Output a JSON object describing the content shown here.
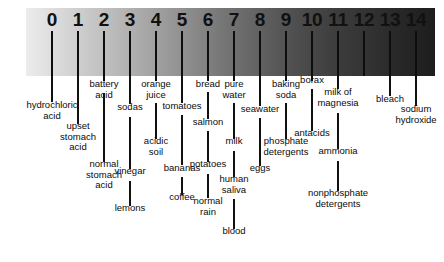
{
  "figure": {
    "gradient_start_color": "#ececec",
    "gradient_end_color": "#1d1d1d"
  },
  "chart_data": {
    "type": "bar",
    "xlabel": "",
    "ylabel": "",
    "xlim": [
      0,
      14
    ],
    "grid": false,
    "legend": null,
    "axis_tick_labels": [
      "0",
      "1",
      "2",
      "3",
      "4",
      "5",
      "6",
      "7",
      "8",
      "9",
      "10",
      "11",
      "12",
      "13",
      "14"
    ],
    "axis_tick_values": [
      0,
      1,
      2,
      3,
      4,
      5,
      6,
      7,
      8,
      9,
      10,
      11,
      12,
      13,
      14
    ],
    "categories": [
      "0",
      "1",
      "2",
      "3",
      "4",
      "5",
      "6",
      "7",
      "8",
      "9",
      "10",
      "11",
      "12",
      "13",
      "14"
    ],
    "values": [
      0,
      1,
      2,
      3,
      4,
      5,
      6,
      7,
      8,
      9,
      10,
      11,
      12,
      13,
      14
    ],
    "annotations": [
      {
        "label": "hydrochloric\nacid",
        "ph": 0
      },
      {
        "label": "upset\nstomach\nacid",
        "ph": 1
      },
      {
        "label": "battery\nacid",
        "ph": 2
      },
      {
        "label": "normal\nstomach\nacid",
        "ph": 2
      },
      {
        "label": "sodas",
        "ph": 3
      },
      {
        "label": "vinegar",
        "ph": 3
      },
      {
        "label": "lemons",
        "ph": 3
      },
      {
        "label": "orange\njuice",
        "ph": 4
      },
      {
        "label": "acidic\nsoil",
        "ph": 4
      },
      {
        "label": "tomatoes",
        "ph": 5
      },
      {
        "label": "bananas",
        "ph": 5
      },
      {
        "label": "coffee",
        "ph": 5
      },
      {
        "label": "bread",
        "ph": 6
      },
      {
        "label": "salmon",
        "ph": 6
      },
      {
        "label": "potatoes",
        "ph": 6
      },
      {
        "label": "normal\nrain",
        "ph": 6
      },
      {
        "label": "pure\nwater",
        "ph": 7
      },
      {
        "label": "milk",
        "ph": 7
      },
      {
        "label": "human\nsaliva",
        "ph": 7
      },
      {
        "label": "blood",
        "ph": 7
      },
      {
        "label": "seawater",
        "ph": 8
      },
      {
        "label": "eggs",
        "ph": 8
      },
      {
        "label": "baking\nsoda",
        "ph": 9
      },
      {
        "label": "phosphate\ndetergents",
        "ph": 9
      },
      {
        "label": "borax",
        "ph": 10
      },
      {
        "label": "antacids",
        "ph": 10
      },
      {
        "label": "milk of\nmagnesia",
        "ph": 11
      },
      {
        "label": "ammonia",
        "ph": 11
      },
      {
        "label": "nonphosphate\ndetergents",
        "ph": 11
      },
      {
        "label": "bleach",
        "ph": 13
      },
      {
        "label": "sodium\nhydroxide",
        "ph": 14
      }
    ]
  },
  "ticks": [
    {
      "value": "0",
      "x": 52,
      "mark_top": 31,
      "mark_height": 45
    },
    {
      "value": "1",
      "x": 78,
      "mark_top": 31,
      "mark_height": 45
    },
    {
      "value": "2",
      "x": 104,
      "mark_top": 31,
      "mark_height": 45
    },
    {
      "value": "3",
      "x": 130,
      "mark_top": 31,
      "mark_height": 45
    },
    {
      "value": "4",
      "x": 156,
      "mark_top": 31,
      "mark_height": 45
    },
    {
      "value": "5",
      "x": 182,
      "mark_top": 31,
      "mark_height": 45
    },
    {
      "value": "6",
      "x": 208,
      "mark_top": 31,
      "mark_height": 45
    },
    {
      "value": "7",
      "x": 234,
      "mark_top": 31,
      "mark_height": 45
    },
    {
      "value": "8",
      "x": 260,
      "mark_top": 31,
      "mark_height": 45
    },
    {
      "value": "9",
      "x": 286,
      "mark_top": 31,
      "mark_height": 45
    },
    {
      "value": "10",
      "x": 312,
      "mark_top": 31,
      "mark_height": 45
    },
    {
      "value": "11",
      "x": 338,
      "mark_top": 31,
      "mark_height": 45
    },
    {
      "value": "12",
      "x": 364,
      "mark_top": 31,
      "mark_height": 45
    },
    {
      "value": "13",
      "x": 390,
      "mark_top": 31,
      "mark_height": 45
    },
    {
      "value": "14",
      "x": 416,
      "mark_top": 31,
      "mark_height": 45
    }
  ],
  "callouts": [
    {
      "id": "hydrochloric-acid",
      "text": "hydrochloric\nacid",
      "x": 52,
      "line_top": 76,
      "line_height": 26,
      "text_top": 100,
      "align": "center"
    },
    {
      "id": "upset-stomach-acid",
      "text": "upset\nstomach\nacid",
      "x": 78,
      "line_top": 76,
      "line_height": 48,
      "text_top": 121,
      "align": "center"
    },
    {
      "id": "battery-acid",
      "text": "battery\nacid",
      "x": 104,
      "line_top": 76,
      "line_height": 5,
      "text_top": 79,
      "align": "center"
    },
    {
      "id": "normal-stomach-acid",
      "text": "normal\nstomach\nacid",
      "x": 104,
      "line_top": 93,
      "line_height": 69,
      "text_top": 159,
      "align": "center"
    },
    {
      "id": "sodas",
      "text": "sodas",
      "x": 130,
      "line_top": 76,
      "line_height": 28,
      "text_top": 102,
      "align": "center"
    },
    {
      "id": "vinegar",
      "text": "vinegar",
      "x": 130,
      "line_top": 117,
      "line_height": 52,
      "text_top": 166,
      "align": "center"
    },
    {
      "id": "lemons",
      "text": "lemons",
      "x": 130,
      "line_top": 181,
      "line_height": 25,
      "text_top": 203,
      "align": "center"
    },
    {
      "id": "orange-juice",
      "text": "orange\njuice",
      "x": 156,
      "line_top": 76,
      "line_height": 5,
      "text_top": 79,
      "align": "center"
    },
    {
      "id": "acidic-soil",
      "text": "acidic\nsoil",
      "x": 156,
      "line_top": 103,
      "line_height": 36,
      "text_top": 136,
      "align": "center"
    },
    {
      "id": "tomatoes",
      "text": "tomatoes",
      "x": 182,
      "line_top": 76,
      "line_height": 27,
      "text_top": 101,
      "align": "center"
    },
    {
      "id": "bananas",
      "text": "bananas",
      "x": 182,
      "line_top": 115,
      "line_height": 50,
      "text_top": 163,
      "align": "center"
    },
    {
      "id": "coffee",
      "text": "coffee",
      "x": 182,
      "line_top": 177,
      "line_height": 18,
      "text_top": 192,
      "align": "center"
    },
    {
      "id": "bread",
      "text": "bread",
      "x": 208,
      "line_top": 76,
      "line_height": 5,
      "text_top": 79,
      "align": "center"
    },
    {
      "id": "salmon",
      "text": "salmon",
      "x": 208,
      "line_top": 92,
      "line_height": 27,
      "text_top": 117,
      "align": "center"
    },
    {
      "id": "potatoes",
      "text": "potatoes",
      "x": 208,
      "line_top": 131,
      "line_height": 31,
      "text_top": 159,
      "align": "center"
    },
    {
      "id": "normal-rain",
      "text": "normal\nrain",
      "x": 208,
      "line_top": 174,
      "line_height": 24,
      "text_top": 196,
      "align": "center"
    },
    {
      "id": "pure-water",
      "text": "pure\nwater",
      "x": 234,
      "line_top": 76,
      "line_height": 5,
      "text_top": 79,
      "align": "center"
    },
    {
      "id": "milk",
      "text": "milk",
      "x": 234,
      "line_top": 103,
      "line_height": 36,
      "text_top": 136,
      "align": "center"
    },
    {
      "id": "human-saliva",
      "text": "human\nsaliva",
      "x": 234,
      "line_top": 151,
      "line_height": 26,
      "text_top": 174,
      "align": "center"
    },
    {
      "id": "blood",
      "text": "blood",
      "x": 234,
      "line_top": 199,
      "line_height": 30,
      "text_top": 226,
      "align": "center"
    },
    {
      "id": "seawater",
      "text": "seawater",
      "x": 260,
      "line_top": 76,
      "line_height": 30,
      "text_top": 104,
      "align": "center"
    },
    {
      "id": "eggs",
      "text": "eggs",
      "x": 260,
      "line_top": 118,
      "line_height": 48,
      "text_top": 163,
      "align": "center"
    },
    {
      "id": "baking-soda",
      "text": "baking\nsoda",
      "x": 286,
      "line_top": 76,
      "line_height": 5,
      "text_top": 79,
      "align": "center"
    },
    {
      "id": "phosphate-detergents",
      "text": "phosphate\ndetergents",
      "x": 286,
      "line_top": 103,
      "line_height": 36,
      "text_top": 136,
      "align": "center"
    },
    {
      "id": "borax",
      "text": "borax",
      "x": 312,
      "line_top": 76,
      "line_height": 5,
      "text_top": 75,
      "align": "center"
    },
    {
      "id": "antacids",
      "text": "antacids",
      "x": 312,
      "line_top": 89,
      "line_height": 42,
      "text_top": 128,
      "align": "center"
    },
    {
      "id": "milk-of-magnesia",
      "text": "milk of\nmagnesia",
      "x": 338,
      "line_top": 76,
      "line_height": 13,
      "text_top": 87,
      "align": "center"
    },
    {
      "id": "ammonia",
      "text": "ammonia",
      "x": 338,
      "line_top": 113,
      "line_height": 36,
      "text_top": 146,
      "align": "center"
    },
    {
      "id": "nonphosphate-detergents",
      "text": "nonphosphate\ndetergents",
      "x": 338,
      "line_top": 161,
      "line_height": 30,
      "text_top": 188,
      "align": "center"
    },
    {
      "id": "bleach",
      "text": "bleach",
      "x": 390,
      "line_top": 76,
      "line_height": 20,
      "text_top": 94,
      "align": "center"
    },
    {
      "id": "sodium-hydroxide",
      "text": "sodium\nhydroxide",
      "x": 416,
      "line_top": 76,
      "line_height": 30,
      "text_top": 104,
      "align": "center"
    }
  ]
}
